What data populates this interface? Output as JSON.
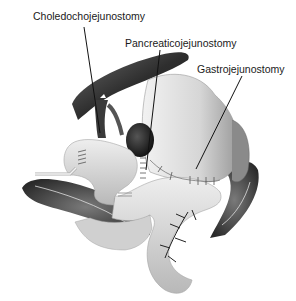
{
  "diagram": {
    "labels": [
      {
        "id": "choledochojejunostomy",
        "text": "Choledochojejunostomy",
        "x": 33,
        "y": 10
      },
      {
        "id": "pancreaticojejunostomy",
        "text": "Pancreaticojejunostomy",
        "x": 125,
        "y": 37
      },
      {
        "id": "gastrojejunostomy",
        "text": "Gastrojejunostomy",
        "x": 197,
        "y": 63
      }
    ],
    "leader_lines": [
      {
        "target": "choledochojejunostomy",
        "from": [
          84,
          27
        ],
        "to": [
          100,
          133
        ]
      },
      {
        "target": "pancreaticojejunostomy",
        "from": [
          160,
          50
        ],
        "to": [
          146,
          170
        ]
      },
      {
        "target": "gastrojejunostomy",
        "from": [
          242,
          76
        ],
        "to": [
          196,
          169
        ]
      }
    ],
    "colors": {
      "background": "#ffffff",
      "text": "#1a1a1a",
      "liver": "#3a3a3a",
      "stomach": "#d8d8d8",
      "jejunum": "#cfcfcf",
      "colon": "#5a5a5a",
      "vessels": "#222222"
    }
  }
}
